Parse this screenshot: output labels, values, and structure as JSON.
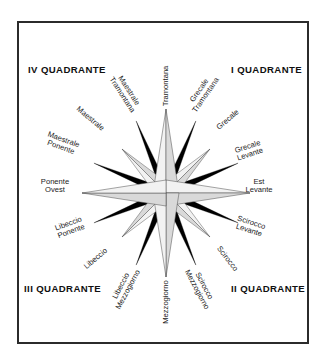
{
  "figure": {
    "background_color": "#ffffff",
    "frame_color": "#2b2b2b"
  },
  "quadrants": [
    {
      "id": "quad-i",
      "label": "I QUADRANTE"
    },
    {
      "id": "quad-ii",
      "label": "II QUADRANTE"
    },
    {
      "id": "quad-iii",
      "label": "III QUADRANTE"
    },
    {
      "id": "quad-iv",
      "label": "IV QUADRANTE"
    }
  ],
  "compass": {
    "center": {
      "x": 166,
      "y": 193
    },
    "cardinal_color": "#f2f2f2",
    "shadow_color": "#d9d9d9",
    "ray_color": "#000000",
    "outline_color": "#4a4a4a",
    "directions": [
      {
        "name": "Tramontana",
        "bearing": 0,
        "line1": "Tramontana",
        "line2": "",
        "kind": "cardinal"
      },
      {
        "name": "Grecale Tramontana",
        "bearing": 22.5,
        "line1": "Grecale",
        "line2": "Tramontana",
        "kind": "half-wind"
      },
      {
        "name": "Grecale",
        "bearing": 45,
        "line1": "Grecale",
        "line2": "",
        "kind": "ordinal"
      },
      {
        "name": "Grecale Levante",
        "bearing": 67.5,
        "line1": "Grecale",
        "line2": "Levante",
        "kind": "half-wind"
      },
      {
        "name": "Est Levante",
        "bearing": 90,
        "line1": "Est",
        "line2": "Levante",
        "kind": "cardinal"
      },
      {
        "name": "Scirocco Levante",
        "bearing": 112.5,
        "line1": "Scirocco",
        "line2": "Levante",
        "kind": "half-wind"
      },
      {
        "name": "Scirocco",
        "bearing": 135,
        "line1": "Scirocco",
        "line2": "",
        "kind": "ordinal"
      },
      {
        "name": "Scirocco Mezzogiorno",
        "bearing": 157.5,
        "line1": "Scirocco",
        "line2": "Mezzogiorno",
        "kind": "half-wind"
      },
      {
        "name": "Mezzogiorno",
        "bearing": 180,
        "line1": "Mezzogiorno",
        "line2": "",
        "kind": "cardinal"
      },
      {
        "name": "Libeccio Mezzogiorno",
        "bearing": 202.5,
        "line1": "Libeccio",
        "line2": "Mezzogiorno",
        "kind": "half-wind"
      },
      {
        "name": "Libeccio",
        "bearing": 225,
        "line1": "Libeccio",
        "line2": "",
        "kind": "ordinal"
      },
      {
        "name": "Libeccio Ponente",
        "bearing": 247.5,
        "line1": "Libeccio",
        "line2": "Ponente",
        "kind": "half-wind"
      },
      {
        "name": "Ponente Ovest",
        "bearing": 270,
        "line1": "Ponente",
        "line2": "Ovest",
        "kind": "cardinal"
      },
      {
        "name": "Maestrale Ponente",
        "bearing": 292.5,
        "line1": "Maestrale",
        "line2": "Ponente",
        "kind": "half-wind"
      },
      {
        "name": "Maestrale",
        "bearing": 315,
        "line1": "Maestrale",
        "line2": "",
        "kind": "ordinal"
      },
      {
        "name": "Maestrale Tramontana",
        "bearing": 337.5,
        "line1": "Maestrale",
        "line2": "Tramontana",
        "kind": "half-wind"
      }
    ]
  },
  "label_positions": [
    {
      "name": "Tramontana",
      "x": 166,
      "y": 86,
      "rotate": -90
    },
    {
      "name": "Grecale Tramontana",
      "x": 203,
      "y": 93,
      "rotate": -55
    },
    {
      "name": "Grecale",
      "x": 228,
      "y": 120,
      "rotate": -40
    },
    {
      "name": "Grecale Levante",
      "x": 249,
      "y": 151,
      "rotate": -18
    },
    {
      "name": "Est Levante",
      "x": 259,
      "y": 186,
      "rotate": 0
    },
    {
      "name": "Scirocco Levante",
      "x": 250,
      "y": 227,
      "rotate": 18
    },
    {
      "name": "Scirocco",
      "x": 227,
      "y": 259,
      "rotate": 52
    },
    {
      "name": "Scirocco Mezzogiorno",
      "x": 200,
      "y": 288,
      "rotate": 62
    },
    {
      "name": "Mezzogiorno",
      "x": 166,
      "y": 302,
      "rotate": -90
    },
    {
      "name": "Libeccio Mezzogiorno",
      "x": 125,
      "y": 288,
      "rotate": -62
    },
    {
      "name": "Libeccio",
      "x": 96,
      "y": 259,
      "rotate": -40
    },
    {
      "name": "Libeccio Ponente",
      "x": 70,
      "y": 228,
      "rotate": -20
    },
    {
      "name": "Ponente Ovest",
      "x": 55,
      "y": 186,
      "rotate": 0
    },
    {
      "name": "Maestrale Ponente",
      "x": 62,
      "y": 144,
      "rotate": 20
    },
    {
      "name": "Maestrale",
      "x": 90,
      "y": 119,
      "rotate": 40
    },
    {
      "name": "Maestrale Tramontana",
      "x": 125,
      "y": 93,
      "rotate": 57
    }
  ]
}
